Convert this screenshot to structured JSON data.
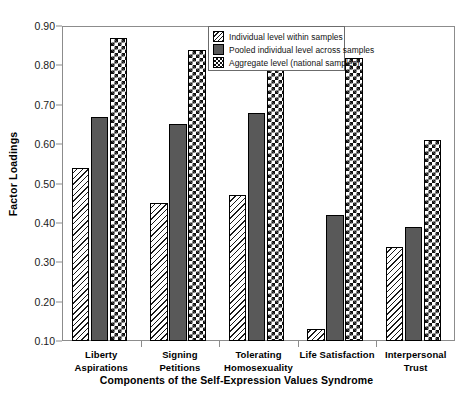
{
  "chart_data": {
    "type": "bar",
    "title": "",
    "xlabel": "Components of the Self-Expression Values Syndrome",
    "ylabel": "Factor Loadings",
    "ylim": [
      0.1,
      0.9
    ],
    "ytick_labels": [
      "0.90",
      "0.80",
      "0.70",
      "0.60",
      "0.50",
      "0.40",
      "0.30",
      "0.20",
      "0.10"
    ],
    "ytick_values": [
      0.9,
      0.8,
      0.7,
      0.6,
      0.5,
      0.4,
      0.3,
      0.2,
      0.1
    ],
    "grid": false,
    "legend_position": "top-center",
    "categories": [
      "Liberty Aspirations",
      "Signing Petitions",
      "Tolerating Homosexuality",
      "Life Satisfaction",
      "Interpersonal Trust"
    ],
    "category_lines": [
      [
        "Liberty Aspirations"
      ],
      [
        "Signing Petitions"
      ],
      [
        "Tolerating",
        "Homosexuality"
      ],
      [
        "Life Satisfaction"
      ],
      [
        "Interpersonal Trust"
      ]
    ],
    "series": [
      {
        "name": "Individual level within samples",
        "pattern": "diagonal-hatch",
        "values": [
          0.54,
          0.45,
          0.47,
          0.13,
          0.34
        ]
      },
      {
        "name": "Pooled individual level across samples",
        "pattern": "solid-gray",
        "values": [
          0.67,
          0.65,
          0.68,
          0.42,
          0.39
        ]
      },
      {
        "name": "Aggregate level (national samples)",
        "pattern": "checkerboard",
        "values": [
          0.87,
          0.84,
          0.82,
          0.82,
          0.61
        ]
      }
    ]
  },
  "legend": {
    "entries": [
      "Individual level within samples",
      "Pooled individual level across samples",
      "Aggregate level (national samples)"
    ]
  },
  "colors": {
    "solid_series": "#595959",
    "pattern_ink": "#111111",
    "frame": "#8c8c8c",
    "text": "#000000",
    "background": "#ffffff"
  }
}
